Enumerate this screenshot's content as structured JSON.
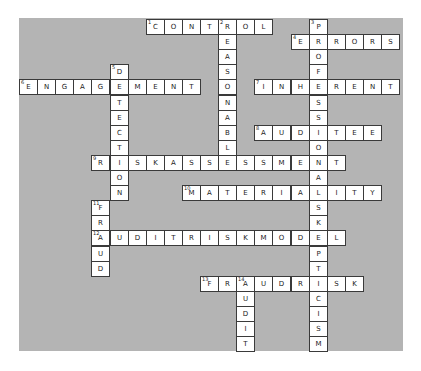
{
  "puzzle": {
    "grid": {
      "origin_x": 19,
      "origin_y": 19,
      "cell_w": 18.1,
      "cell_h": 15.1
    },
    "colors": {
      "panel": "#b4b4b4",
      "cell": "#ffffff",
      "border": "#3a3a3a"
    },
    "words": [
      {
        "number": 1,
        "direction": "across",
        "row": 0,
        "col": 7,
        "answer": "CONTROL"
      },
      {
        "number": 2,
        "direction": "down",
        "row": 0,
        "col": 11,
        "answer": "REASONABLE"
      },
      {
        "number": 3,
        "direction": "down",
        "row": 0,
        "col": 16,
        "answer": "PROFESSIONALSKEPTICISM"
      },
      {
        "number": 4,
        "direction": "across",
        "row": 1,
        "col": 15,
        "answer": "ERRORS"
      },
      {
        "number": 5,
        "direction": "down",
        "row": 3,
        "col": 5,
        "answer": "DETECTION"
      },
      {
        "number": 6,
        "direction": "across",
        "row": 4,
        "col": 0,
        "answer": "ENGAGEMENT"
      },
      {
        "number": 7,
        "direction": "across",
        "row": 4,
        "col": 13,
        "answer": "INHERENT"
      },
      {
        "number": 8,
        "direction": "across",
        "row": 7,
        "col": 13,
        "answer": "AUDITEE"
      },
      {
        "number": 9,
        "direction": "across",
        "row": 9,
        "col": 4,
        "answer": "RISKASSESSMENT"
      },
      {
        "number": 10,
        "direction": "across",
        "row": 11,
        "col": 9,
        "answer": "MATERIALITY"
      },
      {
        "number": 11,
        "direction": "down",
        "row": 12,
        "col": 4,
        "answer": "FRAUD"
      },
      {
        "number": 12,
        "direction": "across",
        "row": 14,
        "col": 4,
        "answer": "AUDITRISKMODEL"
      },
      {
        "number": 13,
        "direction": "across",
        "row": 17,
        "col": 10,
        "answer": "FRAUDRISK"
      },
      {
        "number": 14,
        "direction": "down",
        "row": 17,
        "col": 12,
        "answer": "AUDIT"
      }
    ]
  }
}
